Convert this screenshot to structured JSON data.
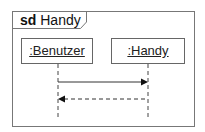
{
  "frame": {
    "keyword": "sd",
    "name": "Handy"
  },
  "lifelines": [
    {
      "label": ":Benutzer"
    },
    {
      "label": ":Handy"
    }
  ],
  "messages": [
    {
      "from": ":Benutzer",
      "to": ":Handy",
      "style": "solid",
      "label": ""
    },
    {
      "from": ":Handy",
      "to": ":Benutzer",
      "style": "dashed",
      "label": ""
    }
  ]
}
